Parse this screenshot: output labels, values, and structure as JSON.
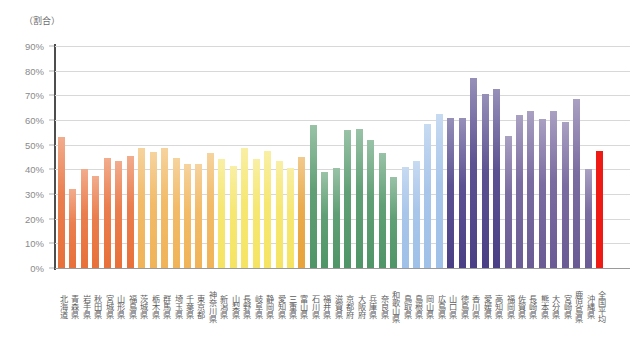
{
  "axis": {
    "unit_label": "（割合）",
    "y_ticks": [
      "0%",
      "10%",
      "20%",
      "30%",
      "40%",
      "50%",
      "60%",
      "70%",
      "80%",
      "90%"
    ]
  },
  "colors": {
    "hokkaido_tohoku": "#e8703a",
    "kanto": "#f0b358",
    "chubu": "#f5e463",
    "kansai_west": "#4f9567",
    "chugoku_light": "#9fc0e8",
    "kyushu_purple": "#4a3f86",
    "national_average": "#f01a14",
    "gridline": "#d8d8d8",
    "axis_line": "#4d4d4d",
    "tick_text": "#8a8a8a"
  },
  "chart_data": {
    "type": "bar",
    "title": "",
    "xlabel": "",
    "ylabel": "（割合）",
    "ylim": [
      0,
      90
    ],
    "grid": true,
    "legend": "none",
    "categories": [
      "北海道",
      "青森県",
      "岩手県",
      "秋田県",
      "宮城県",
      "山形県",
      "福島県",
      "茨城県",
      "栃木県",
      "群馬県",
      "埼玉県",
      "千葉県",
      "東京都",
      "神奈川県",
      "新潟県",
      "山梨県",
      "長野県",
      "岐阜県",
      "静岡県",
      "愛知県",
      "三重県",
      "富山県",
      "石川県",
      "福井県",
      "滋賀県",
      "京都府",
      "大阪府",
      "兵庫県",
      "奈良県",
      "和歌山県",
      "鳥取県",
      "島根県",
      "岡山県",
      "広島県",
      "山口県",
      "徳島県",
      "香川県",
      "愛媛県",
      "高知県",
      "福岡県",
      "佐賀県",
      "長崎県",
      "熊本県",
      "大分県",
      "宮崎県",
      "鹿児島県",
      "沖縄県",
      "全国平均"
    ],
    "values": [
      53.0,
      32.0,
      40.0,
      37.5,
      44.5,
      43.5,
      45.5,
      48.5,
      47.0,
      48.5,
      44.5,
      42.0,
      42.0,
      46.5,
      44.0,
      41.5,
      48.5,
      44.0,
      47.5,
      43.5,
      40.5,
      45.0,
      58.0,
      39.0,
      40.5,
      56.0,
      56.5,
      52.0,
      46.5,
      37.0,
      41.0,
      43.5,
      58.5,
      62.5,
      61.0,
      61.0,
      77.0,
      70.5,
      72.5,
      53.5,
      62.0,
      63.5,
      60.5,
      63.5,
      59.0,
      68.5,
      40.0,
      47.5
    ],
    "series_colors": [
      "#e8703a",
      "#e8703a",
      "#e8703a",
      "#e8703a",
      "#e8703a",
      "#e8703a",
      "#e8703a",
      "#f0b358",
      "#f0b358",
      "#f0b358",
      "#f0b358",
      "#f0b358",
      "#f0b358",
      "#f0b358",
      "#f5e463",
      "#f5e463",
      "#f5e463",
      "#f5e463",
      "#f5e463",
      "#f5e463",
      "#f5e463",
      "#e8a33a",
      "#4f9567",
      "#4f9567",
      "#4f9567",
      "#4f9567",
      "#4f9567",
      "#4f9567",
      "#4f9567",
      "#4f9567",
      "#9fc0e8",
      "#9fc0e8",
      "#9fc0e8",
      "#9fc0e8",
      "#4a3f86",
      "#4a3f86",
      "#4a3f86",
      "#4a3f86",
      "#4a3f86",
      "#6b5b95",
      "#6b5b95",
      "#6b5b95",
      "#6b5b95",
      "#6b5b95",
      "#6b5b95",
      "#6b5b95",
      "#6b5b95",
      "#f01a14"
    ]
  }
}
